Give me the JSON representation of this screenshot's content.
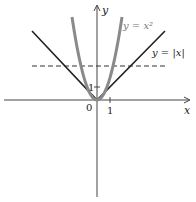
{
  "diagram": {
    "axes": {
      "x_label": "x",
      "y_label": "y",
      "origin_label": "0",
      "x_tick_label": "1",
      "y_tick_label": "1"
    },
    "curves": [
      {
        "name": "parabola",
        "label": "y = x²",
        "equation": "y = x^2",
        "color": "#8a8a8a",
        "style": "solid-thick"
      },
      {
        "name": "absolute-value",
        "label": "y = |x|",
        "equation": "y = |x|",
        "color": "#222222",
        "style": "solid"
      }
    ],
    "dashed_line": {
      "equation": "y = c (horizontal)",
      "color": "#333333",
      "style": "dashed"
    }
  }
}
